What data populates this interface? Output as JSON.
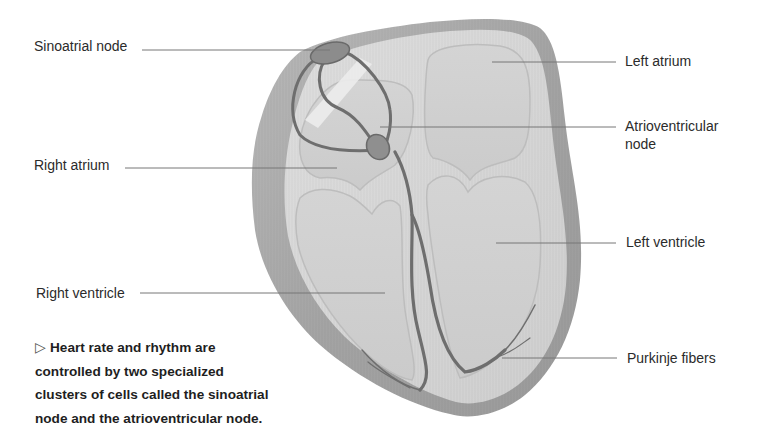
{
  "diagram": {
    "labels": [
      {
        "id": "sinoatrial-node",
        "text": "Sinoatrial node",
        "side": "left"
      },
      {
        "id": "right-atrium",
        "text": "Right atrium",
        "side": "left"
      },
      {
        "id": "right-ventricle",
        "text": "Right ventricle",
        "side": "left"
      },
      {
        "id": "left-atrium",
        "text": "Left atrium",
        "side": "right"
      },
      {
        "id": "atrioventricular-node",
        "text": "Atrioventricular",
        "text2": "node",
        "side": "right"
      },
      {
        "id": "left-ventricle",
        "text": "Left ventricle",
        "side": "right"
      },
      {
        "id": "purkinje-fibers",
        "text": "Purkinje fibers",
        "side": "right"
      }
    ],
    "caption": {
      "marker": "▷",
      "text": "Heart rate and rhythm are controlled by two specialized clusters of cells called the sinoatrial node and the atrioventricular node.",
      "lines": [
        "Heart rate and rhythm are",
        "controlled by two specialized",
        "clusters of cells called the sinoatrial",
        "node and the atrioventricular node."
      ]
    },
    "colors": {
      "outer_wall": "#9a9a9a",
      "muscle": "#c9c9c9",
      "chamber": "#d6d6d6",
      "septum_light": "#ececec",
      "conduction": "#6e6e6e",
      "leader_line": "#777777"
    }
  }
}
